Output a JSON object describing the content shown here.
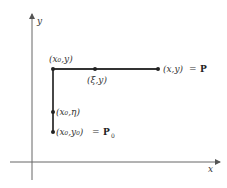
{
  "diagram": {
    "axes": {
      "x_label": "x",
      "y_label": "y"
    },
    "points": [
      {
        "id": "corner",
        "label": "(x₀,y)",
        "x": 53,
        "y": 69
      },
      {
        "id": "xi",
        "label": "(ξ,y)",
        "x": 95,
        "y": 69
      },
      {
        "id": "P",
        "label": "(x,y)",
        "eq": "=",
        "name": "P",
        "x": 158,
        "y": 69
      },
      {
        "id": "eta",
        "label": "(x₀,η)",
        "x": 53,
        "y": 112
      },
      {
        "id": "P0",
        "label": "(x₀,y₀)",
        "eq": "=",
        "name": "P",
        "sub": "0",
        "x": 53,
        "y": 132
      }
    ],
    "path": "P0 → (x₀,η) → (x₀,y) → (ξ,y) → P",
    "colors": {
      "line": "#333333",
      "axis": "#555555",
      "point": "#222222"
    }
  }
}
